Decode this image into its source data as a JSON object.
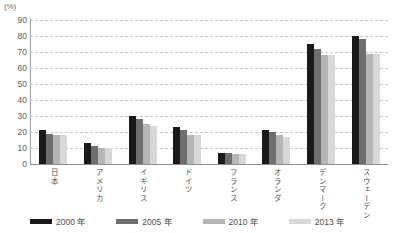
{
  "chart_data": {
    "type": "bar",
    "title": "",
    "xlabel": "",
    "ylabel": "(%)",
    "unit_label": "(%)",
    "ylim": [
      0,
      90
    ],
    "ytick_step": 10,
    "yticks": [
      "90",
      "80",
      "70",
      "60",
      "50",
      "40",
      "30",
      "20",
      "10",
      "0"
    ],
    "grid": true,
    "legend_position": "bottom",
    "categories": [
      "日本",
      "アメリカ",
      "イギリス",
      "ドイツ",
      "フランス",
      "オランダ",
      "デンマーク",
      "スウェーデン"
    ],
    "series": [
      {
        "name": "2000 年",
        "color": "#1a1a1a",
        "values": [
          21,
          13,
          30,
          23,
          7,
          21,
          75,
          80
        ]
      },
      {
        "name": "2005 年",
        "color": "#6e6e6e",
        "values": [
          19,
          11,
          28,
          21,
          7,
          20,
          72,
          78
        ]
      },
      {
        "name": "2010 年",
        "color": "#b5b5b5",
        "values": [
          18,
          10,
          25,
          18,
          6,
          18,
          68,
          69
        ]
      },
      {
        "name": "2013 年",
        "color": "#d8d8d8",
        "values": [
          18,
          10,
          24,
          18,
          6,
          17,
          68,
          69
        ]
      }
    ]
  }
}
